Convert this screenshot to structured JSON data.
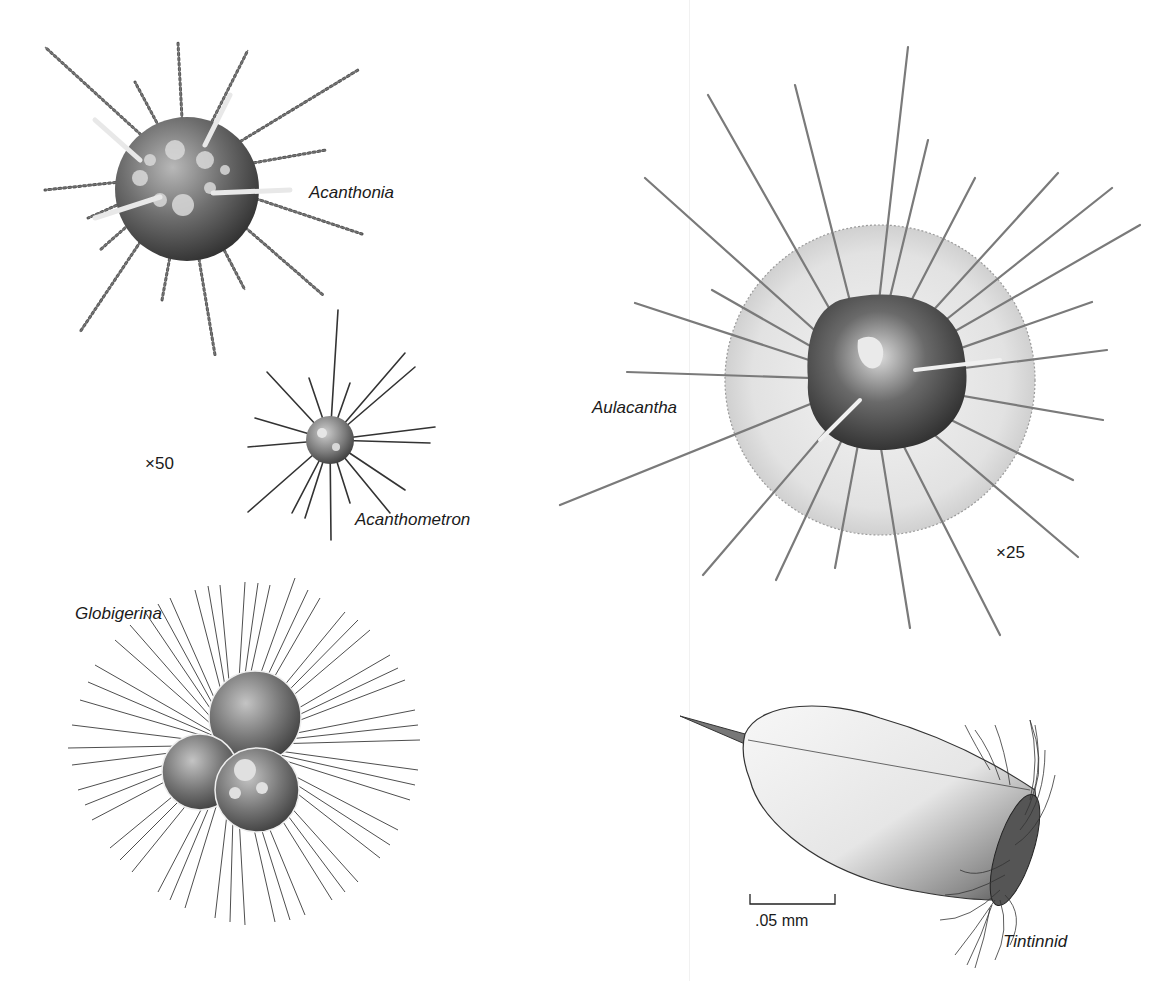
{
  "figure": {
    "background": "#ffffff",
    "ink_color": "#1a1a1a",
    "organisms": [
      {
        "id": "acanthonia",
        "label": "Acanthonia",
        "type": "radiolarian with barbed spines"
      },
      {
        "id": "acanthometron",
        "label": "Acanthometron",
        "type": "radiolarian with smooth spines"
      },
      {
        "id": "globigerina",
        "label": "Globigerina",
        "type": "foraminifer, three-chambered with fine spines"
      },
      {
        "id": "aulacantha",
        "label": "Aulacantha",
        "type": "radiolarian with frothy outer sphere and long barbed spines"
      },
      {
        "id": "tintinnid",
        "label": "Tintinnid",
        "type": "ciliate in vase-shaped lorica with oral cilia"
      }
    ],
    "magnifications": {
      "left_group": "×50",
      "aulacantha": "×25"
    },
    "scale_bar": {
      "label": ".05 mm"
    }
  }
}
